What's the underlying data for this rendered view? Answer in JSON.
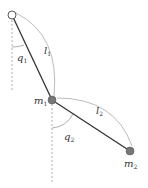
{
  "diagram": {
    "labels": {
      "l1": "l",
      "l1_sub": "1",
      "l2": "l",
      "l2_sub": "2",
      "q1": "q",
      "q1_sub": "1",
      "q2": "q",
      "q2_sub": "2",
      "m1": "m",
      "m1_sub": "1",
      "m2": "m",
      "m2_sub": "2"
    },
    "colors": {
      "rod": "#333333",
      "mass": "#777777",
      "pivot_fill": "#ffffff",
      "arc": "#aaaaaa",
      "dashed": "#999999"
    }
  }
}
